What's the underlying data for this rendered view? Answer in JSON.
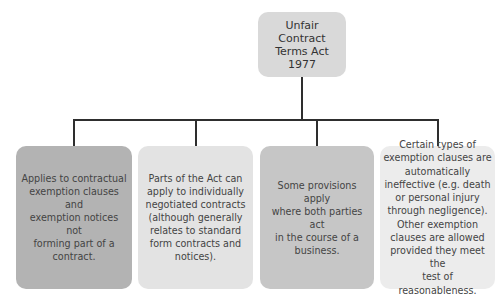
{
  "diagram": {
    "type": "hierarchy",
    "root": {
      "label": "Unfair\nContract\nTerms Act\n1977",
      "color": "#d9d9d9"
    },
    "children": [
      {
        "label": "Applies to contractual\nexemption clauses and\nexemption notices not\nforming part of a\ncontract.",
        "color": "#b3b3b3"
      },
      {
        "label": "Parts of the Act can\napply to individually\nnegotiated contracts\n(although generally\nrelates to standard\nform contracts and\nnotices).",
        "color": "#e3e3e3"
      },
      {
        "label": "Some provisions apply\nwhere both parties act\nin the course of a\nbusiness.",
        "color": "#c6c6c6"
      },
      {
        "label": "Certain types of\nexemption clauses are\nautomatically\nineffective (e.g. death\nor personal injury\nthrough negligence).\nOther exemption\nclauses are allowed\nprovided they meet the\ntest of reasonableness.",
        "color": "#ececec"
      }
    ],
    "connector_color": "#2e2e2e"
  }
}
